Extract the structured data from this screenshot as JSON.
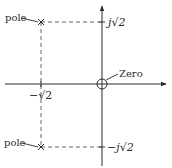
{
  "diagram": {
    "type": "pole-zero-plot",
    "colors": {
      "ink": "#2a2a2a",
      "dashed": "#555555",
      "background": "#ffffff"
    },
    "labels": {
      "pole_upper": "pole",
      "pole_lower": "pole",
      "zero": "Zero",
      "imag_pos": "j√2",
      "imag_neg": "−j√2",
      "real_neg": "−√2"
    },
    "points": [
      {
        "kind": "pole",
        "marker": "x",
        "real": "-√2",
        "imag": "√2"
      },
      {
        "kind": "pole",
        "marker": "x",
        "real": "-√2",
        "imag": "-√2"
      },
      {
        "kind": "zero",
        "marker": "o",
        "real": "0",
        "imag": "0"
      }
    ]
  }
}
